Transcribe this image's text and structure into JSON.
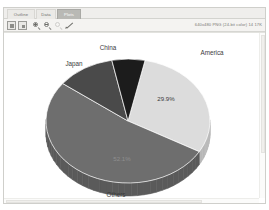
{
  "window": {
    "tabs": [
      {
        "label": "Outline",
        "active": false
      },
      {
        "label": "Data",
        "active": false
      },
      {
        "label": "Plots",
        "active": true
      }
    ],
    "toolbar": {
      "buttons": [
        {
          "name": "fit-page-button",
          "icon": "framed-square-icon"
        },
        {
          "name": "actual-size-button",
          "icon": "framed-square-small-icon"
        },
        {
          "name": "zoom-in-button",
          "icon": "magnifier-plus-icon"
        },
        {
          "name": "zoom-out-button",
          "icon": "magnifier-minus-icon"
        },
        {
          "name": "zoom-reset-button",
          "icon": "magnifier-icon"
        },
        {
          "name": "pick-tool-button",
          "icon": "pencil-icon"
        }
      ],
      "status": "640x480 PNG (24-bit color) 14 17K"
    }
  },
  "chart_data": {
    "type": "pie",
    "title": "",
    "legend_position": "none",
    "labels_outside": true,
    "categories": [
      "America",
      "Others",
      "Japan",
      "China"
    ],
    "values": [
      29.9,
      52.1,
      11.5,
      6.5
    ],
    "value_labels": [
      "29.9%",
      "52.1%",
      "",
      ""
    ],
    "colors": [
      "#dcdcdc",
      "#6e6e6e",
      "#4a4a4a",
      "#1c1c1c"
    ],
    "side_colors": [
      "#b8b8b8",
      "#5a5a5a",
      "#3b3b3b",
      "#141414"
    ],
    "annotations": [
      {
        "text": "America",
        "x": 208,
        "y": 22
      },
      {
        "text": "China",
        "x": 104,
        "y": 17
      },
      {
        "text": "Japan",
        "x": 70,
        "y": 33
      },
      {
        "text": "Others",
        "x": 112,
        "y": 164
      }
    ],
    "pct_annotations": [
      {
        "text": "29.9%",
        "x": 162,
        "y": 68,
        "tone": "on-light"
      },
      {
        "text": "52.1%",
        "x": 118,
        "y": 128,
        "tone": "on-dark"
      }
    ]
  }
}
